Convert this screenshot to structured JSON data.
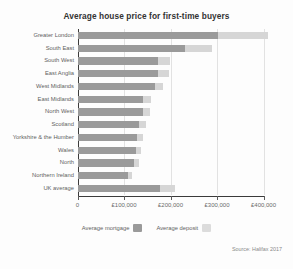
{
  "chart_data": {
    "type": "bar",
    "orientation": "horizontal",
    "stacked": true,
    "title": "Average house price for first-time buyers",
    "xlabel": "",
    "ylabel": "",
    "xlim": [
      0,
      400000
    ],
    "grid": true,
    "legend_position": "bottom-center",
    "source": "Source: Halifax 2017",
    "xticks": [
      {
        "value": 0,
        "label": "0"
      },
      {
        "value": 100000,
        "label": "£100,000"
      },
      {
        "value": 200000,
        "label": "£200,000"
      },
      {
        "value": 300000,
        "label": "£300,000"
      },
      {
        "value": 400000,
        "label": "£400,000"
      }
    ],
    "categories": [
      "Greater London",
      "South East",
      "South West",
      "East Anglia",
      "West Midlands",
      "East Midlands",
      "North West",
      "Scotland",
      "Yorkshire & the Humber",
      "Wales",
      "North",
      "Northern Ireland",
      "UK average"
    ],
    "series": [
      {
        "name": "Average mortgage",
        "color": "#9a9a9a",
        "values": [
          303000,
          231000,
          174000,
          174000,
          166000,
          141000,
          140000,
          133000,
          128000,
          125000,
          122000,
          109000,
          177000
        ]
      },
      {
        "name": "Average deposit",
        "color": "#d6d6d6",
        "values": [
          107000,
          58000,
          24000,
          22000,
          18000,
          17000,
          15000,
          14000,
          13000,
          12000,
          11000,
          9000,
          33000
        ]
      }
    ],
    "totals": [
      410000,
      289000,
      198000,
      196000,
      184000,
      158000,
      155000,
      147000,
      141000,
      137000,
      133000,
      118000,
      210000
    ]
  },
  "legend": {
    "items": [
      {
        "label": "Average mortgage",
        "swatch": "mortgage"
      },
      {
        "label": "Average deposit",
        "swatch": "deposit"
      }
    ]
  }
}
